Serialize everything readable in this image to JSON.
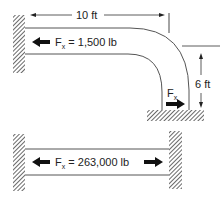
{
  "diagram": {
    "type": "pipe-force-diagram",
    "top_figure": {
      "description": "Pipe anchored to wall, 90-degree elbow, vertical leg anchored to ground",
      "horizontal_dimension": {
        "label": "10 ft"
      },
      "vertical_dimension": {
        "label": "6 ft"
      },
      "force_label_main": {
        "symbol": "F",
        "subscript": "x",
        "value": " = 1,500 lb"
      },
      "force_label_elbow": {
        "symbol": "F",
        "subscript": "x"
      }
    },
    "bottom_figure": {
      "description": "Straight pipe anchored between two walls",
      "force_label": {
        "symbol": "F",
        "subscript": "x",
        "value": " = 263,000 lb"
      }
    },
    "colors": {
      "line": "#444444",
      "arrow": "#111111",
      "hatch": "#555555",
      "background": "#ffffff"
    }
  }
}
